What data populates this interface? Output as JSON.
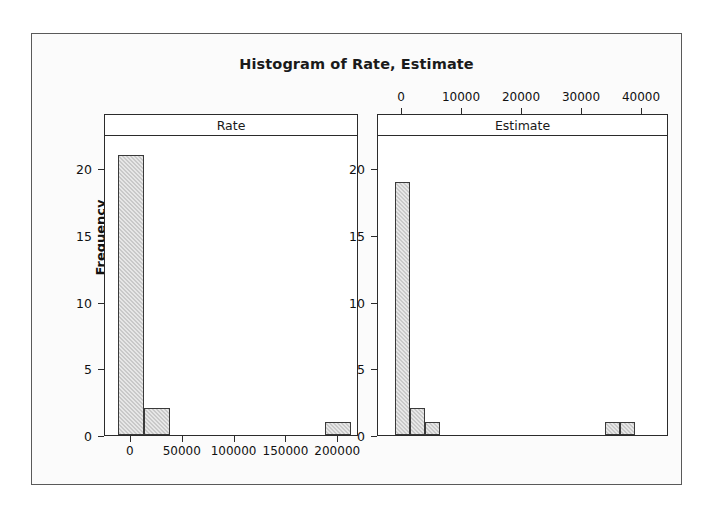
{
  "chart_data": {
    "type": "bar",
    "title": "Histogram of Rate, Estimate",
    "ylabel": "Frequency",
    "xlabel": "",
    "grid": false,
    "legend": "none",
    "panels": [
      {
        "name": "rate-panel",
        "label": "Rate",
        "xlabel_position": "bottom",
        "xticks": [
          0,
          50000,
          100000,
          150000,
          200000
        ],
        "xtick_labels": [
          "0",
          "50000",
          "100000",
          "150000",
          "200000"
        ],
        "xlim": [
          -25000,
          220000
        ],
        "yticks": [
          0,
          5,
          10,
          15,
          20
        ],
        "ytick_labels": [
          "0",
          "5",
          "10",
          "15",
          "20"
        ],
        "ylim": [
          0,
          22.5
        ],
        "bin_width": 25000,
        "bins": [
          {
            "x0": -12500,
            "x1": 12500,
            "value": 21
          },
          {
            "x0": 12500,
            "x1": 37500,
            "value": 2
          },
          {
            "x0": 187500,
            "x1": 212500,
            "value": 1
          }
        ]
      },
      {
        "name": "estimate-panel",
        "label": "Estimate",
        "xlabel_position": "top",
        "xticks": [
          0,
          10000,
          20000,
          30000,
          40000
        ],
        "xtick_labels": [
          "0",
          "10000",
          "20000",
          "30000",
          "40000"
        ],
        "xlim": [
          -4000,
          44500
        ],
        "yticks": [
          0,
          5,
          10,
          15,
          20
        ],
        "ytick_labels": [
          "0",
          "5",
          "10",
          "15",
          "20"
        ],
        "ylim": [
          0,
          22.5
        ],
        "bin_width": 2500,
        "bins": [
          {
            "x0": -1250,
            "x1": 1250,
            "value": 19
          },
          {
            "x0": 1250,
            "x1": 3750,
            "value": 2
          },
          {
            "x0": 3750,
            "x1": 6250,
            "value": 1
          },
          {
            "x0": 33750,
            "x1": 36250,
            "value": 1
          },
          {
            "x0": 36250,
            "x1": 38750,
            "value": 1
          }
        ]
      }
    ],
    "colors": {
      "bar_fill": "#c9c9c9",
      "bar_edge": "#3a3a3a",
      "frame": "#5a5a5a",
      "panel_border": "#2b2b2b",
      "background": "#fbfbfb",
      "plot_background": "#ffffff",
      "text": "#111111"
    }
  }
}
